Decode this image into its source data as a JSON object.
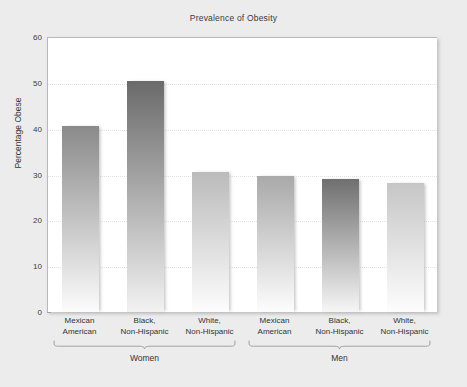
{
  "chart_data": {
    "type": "bar",
    "title": "Prevalence of Obesity",
    "xlabel": "",
    "ylabel": "Percentage Obese",
    "ylim": [
      0,
      60
    ],
    "yticks": [
      0,
      10,
      20,
      30,
      40,
      50,
      60
    ],
    "grid": true,
    "legend": "none",
    "categories": [
      "Mexican American",
      "Black, Non-Hispanic",
      "White, Non-Hispanic",
      "Mexican American",
      "Black, Non-Hispanic",
      "White, Non-Hispanic"
    ],
    "values": [
      40.5,
      50.5,
      30.5,
      29.7,
      29.0,
      28.2
    ],
    "groups": [
      {
        "name": "Women",
        "categories": [
          "Mexican American",
          "Black, Non-Hispanic",
          "White, Non-Hispanic"
        ],
        "values": [
          40.5,
          50.5,
          30.5
        ]
      },
      {
        "name": "Men",
        "categories": [
          "Mexican American",
          "Black, Non-Hispanic",
          "White, Non-Hispanic"
        ],
        "values": [
          29.7,
          29.0,
          28.2
        ]
      }
    ]
  },
  "chart": {
    "title": "Prevalence of Obesity",
    "y_axis": {
      "label": "Percentage Obese",
      "ticks": [
        "0",
        "10",
        "20",
        "30",
        "40",
        "50",
        "60"
      ],
      "min": 0,
      "max": 60
    },
    "bars": [
      {
        "line1": "Mexican",
        "line2": "American",
        "value": 40.5,
        "top_color": "#8a8a8a",
        "bottom_color": "#fcfcfc"
      },
      {
        "line1": "Black,",
        "line2": "Non-Hispanic",
        "value": 50.5,
        "top_color": "#6a6a6a",
        "bottom_color": "#f2f2f2"
      },
      {
        "line1": "White,",
        "line2": "Non-Hispanic",
        "value": 30.5,
        "top_color": "#bbbbbb",
        "bottom_color": "#fdfdfd"
      },
      {
        "line1": "Mexican",
        "line2": "American",
        "value": 29.7,
        "top_color": "#a9a9a9",
        "bottom_color": "#fdfdfd"
      },
      {
        "line1": "Black,",
        "line2": "Non-Hispanic",
        "value": 29.0,
        "top_color": "#6f6f6f",
        "bottom_color": "#f6f6f6"
      },
      {
        "line1": "White,",
        "line2": "Non-Hispanic",
        "value": 28.2,
        "top_color": "#c6c6c6",
        "bottom_color": "#fdfdfd"
      }
    ],
    "groups": [
      {
        "label": "Women"
      },
      {
        "label": "Men"
      }
    ],
    "colors": {
      "page_background": "#ececec",
      "plot_background": "#ffffff",
      "axis": "#a8a8aa",
      "gridline": "#e2e2e8",
      "text": "#333333"
    }
  }
}
